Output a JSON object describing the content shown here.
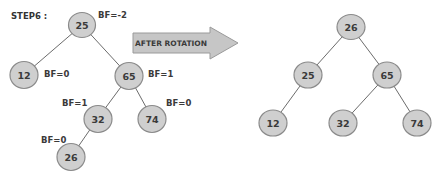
{
  "step_label": "STEP6 :",
  "arrow": {
    "label": "AFTER ROTATION",
    "fill": "#c6c6c6",
    "stroke": "#9a9a9a"
  },
  "colors": {
    "node_fill": "#cfcfcf",
    "node_stroke": "#8a8a8a",
    "edge": "#5a5a5a",
    "text": "#3a3a3a"
  },
  "before_tree": {
    "nodes": [
      {
        "id": "b25",
        "value": "25",
        "bf": "BF=-2"
      },
      {
        "id": "b12",
        "value": "12",
        "bf": "BF=0"
      },
      {
        "id": "b65",
        "value": "65",
        "bf": "BF=1"
      },
      {
        "id": "b32",
        "value": "32",
        "bf": "BF=1"
      },
      {
        "id": "b74",
        "value": "74",
        "bf": "BF=0"
      },
      {
        "id": "b26",
        "value": "26",
        "bf": "BF=0"
      }
    ],
    "edges": [
      [
        "25",
        "12"
      ],
      [
        "25",
        "65"
      ],
      [
        "65",
        "32"
      ],
      [
        "65",
        "74"
      ],
      [
        "32",
        "26"
      ]
    ]
  },
  "after_tree": {
    "nodes": [
      {
        "id": "a26",
        "value": "26"
      },
      {
        "id": "a25",
        "value": "25"
      },
      {
        "id": "a65",
        "value": "65"
      },
      {
        "id": "a12",
        "value": "12"
      },
      {
        "id": "a32",
        "value": "32"
      },
      {
        "id": "a74",
        "value": "74"
      }
    ],
    "edges": [
      [
        "26",
        "25"
      ],
      [
        "26",
        "65"
      ],
      [
        "25",
        "12"
      ],
      [
        "65",
        "32"
      ],
      [
        "65",
        "74"
      ]
    ]
  }
}
